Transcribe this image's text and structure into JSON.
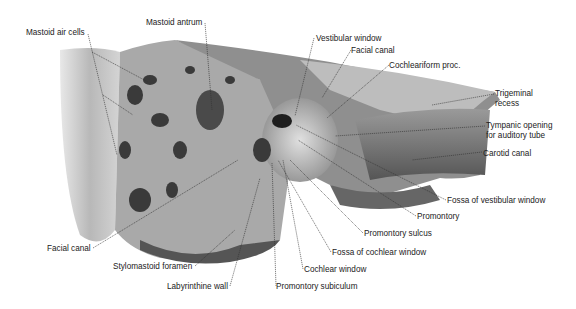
{
  "figure": {
    "labels": [
      {
        "id": "mastoid-air-cells",
        "text": "Mastoid air cells",
        "x": 26,
        "y": 28
      },
      {
        "id": "mastoid-antrum",
        "text": "Mastoid antrum",
        "x": 146,
        "y": 18
      },
      {
        "id": "vestibular-window",
        "text": "Vestibular window",
        "x": 316,
        "y": 34
      },
      {
        "id": "facial-canal-top",
        "text": "Facial canal",
        "x": 351,
        "y": 46
      },
      {
        "id": "cochleariform-proc",
        "text": "Cochleariform proc.",
        "x": 389,
        "y": 61
      },
      {
        "id": "trigeminal-recess-1",
        "text": "Trigeminal",
        "x": 495,
        "y": 91
      },
      {
        "id": "trigeminal-recess-2",
        "text": "recess",
        "x": 495,
        "y": 101
      },
      {
        "id": "tympanic-opening-1",
        "text": "Tympanic opening",
        "x": 486,
        "y": 122
      },
      {
        "id": "tympanic-opening-2",
        "text": "for auditory tube",
        "x": 486,
        "y": 132
      },
      {
        "id": "carotid-canal",
        "text": "Carotid canal",
        "x": 483,
        "y": 149
      },
      {
        "id": "fossa-vestibular-window",
        "text": "Fossa of vestibular window",
        "x": 447,
        "y": 196
      },
      {
        "id": "promontory",
        "text": "Promontory",
        "x": 417,
        "y": 212
      },
      {
        "id": "promontory-sulcus",
        "text": "Promontory sulcus",
        "x": 364,
        "y": 229
      },
      {
        "id": "fossa-cochlear-window",
        "text": "Fossa of cochlear window",
        "x": 332,
        "y": 248
      },
      {
        "id": "cochlear-window",
        "text": "Cochlear window",
        "x": 304,
        "y": 265
      },
      {
        "id": "promontory-subiculum",
        "text": "Promontory subiculum",
        "x": 276,
        "y": 282
      },
      {
        "id": "facial-canal-bottom",
        "text": "Facial canal",
        "x": 47,
        "y": 244
      },
      {
        "id": "stylomastoid-foramen",
        "text": "Stylomastoid foramen",
        "x": 113,
        "y": 262
      },
      {
        "id": "labyrinthine-wall",
        "text": "Labyrinthine wall",
        "x": 167,
        "y": 282
      }
    ]
  }
}
